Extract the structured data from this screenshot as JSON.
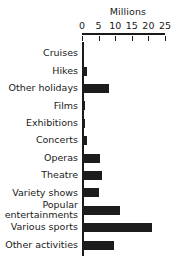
{
  "chart_data": {
    "type": "bar",
    "orientation": "horizontal",
    "title": "",
    "xlabel": "Millions",
    "ylabel": "",
    "xlim": [
      0,
      25
    ],
    "xticks": [
      0,
      5,
      10,
      15,
      20,
      25
    ],
    "xtick_labels": [
      "0",
      "5",
      "10",
      "15",
      "20",
      "25"
    ],
    "grid": false,
    "legend": false,
    "bar_color": "#1c1c1c",
    "background_color": "#ffffff",
    "categories": [
      "Cruises",
      "Hikes",
      "Other holidays",
      "Films",
      "Exhibitions",
      "Concerts",
      "Operas",
      "Theatre",
      "Variety shows",
      "Popular\nentertainments",
      "Various sports",
      "Other activities"
    ],
    "values": [
      0.5,
      1.5,
      8,
      1,
      1,
      1.5,
      5.5,
      6,
      5,
      11.5,
      21,
      9.5
    ]
  },
  "axis": {
    "unit_label": "Millions"
  }
}
